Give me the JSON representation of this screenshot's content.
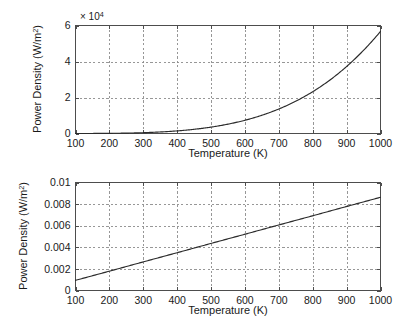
{
  "figure": {
    "name": "blackbody-power-density-figure",
    "background_color": "#ffffff",
    "line_color": "#2b2b2b",
    "grid_color": "#8c8c8c",
    "axis_color": "#4d4d4d"
  },
  "panels": {
    "top": {
      "exponent_prefix": "× 10",
      "exponent_power": "4",
      "xlabel_text": "Temperature (K)",
      "ylabel_main": "Power Density (W/m",
      "ylabel_sup": "2",
      "ylabel_close": ")",
      "xticks": [
        "100",
        "200",
        "300",
        "400",
        "500",
        "600",
        "700",
        "800",
        "900",
        "1000"
      ],
      "yticks": [
        "0",
        "2",
        "4",
        "6"
      ]
    },
    "bottom": {
      "xlabel_text": "Temperature (K)",
      "ylabel_main": "Power Density (W/m",
      "ylabel_sup": "2",
      "ylabel_close": ")",
      "xticks": [
        "100",
        "200",
        "300",
        "400",
        "500",
        "600",
        "700",
        "800",
        "900",
        "1000"
      ],
      "yticks": [
        "0",
        "0.002",
        "0.004",
        "0.006",
        "0.008",
        "0.01"
      ]
    }
  },
  "chart_data": [
    {
      "type": "line",
      "title": "",
      "panel": "top",
      "xlabel": "Temperature (K)",
      "ylabel": "Power Density (W/m^2)",
      "y_exponent_multiplier": 10000,
      "y_exponent_label": "x 10^4",
      "xlim": [
        100,
        1000
      ],
      "ylim": [
        0,
        60000
      ],
      "xticks": [
        100,
        200,
        300,
        400,
        500,
        600,
        700,
        800,
        900,
        1000
      ],
      "yticks": [
        0,
        20000,
        40000,
        60000
      ],
      "grid": true,
      "legend": "none",
      "series": [
        {
          "name": "Stefan-Boltzmann power density",
          "x": [
            100,
            150,
            200,
            250,
            300,
            350,
            400,
            450,
            500,
            550,
            600,
            650,
            700,
            750,
            800,
            850,
            900,
            950,
            1000
          ],
          "values": [
            5.67,
            28.7,
            90.7,
            221.5,
            459.3,
            850.9,
            1451.5,
            2323.7,
            3543.8,
            5195.9,
            7348.3,
            10131.2,
            13613.4,
            17939.3,
            23224.3,
            29599.9,
            37220.0,
            46219.2,
            56700.0
          ]
        }
      ]
    },
    {
      "type": "line",
      "title": "",
      "panel": "bottom",
      "xlabel": "Temperature (K)",
      "ylabel": "Power Density (W/m^2)",
      "xlim": [
        100,
        1000
      ],
      "ylim": [
        0,
        0.01
      ],
      "xticks": [
        100,
        200,
        300,
        400,
        500,
        600,
        700,
        800,
        900,
        1000
      ],
      "yticks": [
        0,
        0.002,
        0.004,
        0.006,
        0.008,
        0.01
      ],
      "grid": true,
      "legend": "none",
      "series": [
        {
          "name": "Linear power density",
          "x": [
            100,
            200,
            300,
            400,
            500,
            600,
            700,
            800,
            900,
            1000
          ],
          "values": [
            0.00094,
            0.00179,
            0.00265,
            0.0035,
            0.00436,
            0.00521,
            0.00607,
            0.00692,
            0.00778,
            0.00863
          ]
        }
      ]
    }
  ]
}
